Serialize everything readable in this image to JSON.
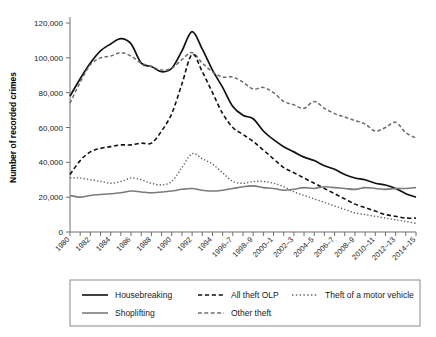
{
  "chart_data": {
    "type": "line",
    "title": "",
    "xlabel": "",
    "ylabel": "Number of recorded crimes",
    "ylim": [
      0,
      120000
    ],
    "ytick_labels": [
      "0",
      "20,000",
      "40,000",
      "60,000",
      "80,000",
      "100,000",
      "120,000"
    ],
    "ytick_values": [
      0,
      20000,
      40000,
      60000,
      80000,
      100000,
      120000
    ],
    "grid": false,
    "legend_position": "bottom",
    "categories": [
      "1980",
      "1981",
      "1982",
      "1983",
      "1984",
      "1985",
      "1986",
      "1987",
      "1988",
      "1989",
      "1990",
      "1991",
      "1992",
      "1993",
      "1994",
      "1995",
      "1996-7",
      "1997-8",
      "1998-9",
      "1999-2000",
      "2000-1",
      "2001-2",
      "2002-3",
      "2003-4",
      "2004-5",
      "2005-6",
      "2006-7",
      "2007-8",
      "2008-9",
      "2009-10",
      "2010-11",
      "2011-12",
      "2012-13",
      "2013-14",
      "2014-15"
    ],
    "xtick_labels_shown": [
      "1980",
      "1982",
      "1984",
      "1986",
      "1988",
      "1990",
      "1992",
      "1994",
      "1996-7",
      "1998-9",
      "2000-1",
      "2002-3",
      "2004-5",
      "2006-7",
      "2008-9",
      "2010-11",
      "2012-13",
      "2014-15"
    ],
    "series": [
      {
        "name": "Housebreaking",
        "style": "solid",
        "color": "#111111",
        "width": 1.7,
        "values": [
          78000,
          88000,
          97000,
          104000,
          108000,
          111000,
          108000,
          97000,
          95000,
          92000,
          94000,
          104000,
          115000,
          105000,
          93000,
          83000,
          72000,
          67000,
          65000,
          58000,
          53000,
          49000,
          46000,
          43000,
          41000,
          38000,
          36000,
          33000,
          31000,
          30000,
          28000,
          27000,
          25000,
          22000,
          20000
        ]
      },
      {
        "name": "Other theft",
        "style": "dashed-long",
        "color": "#6b6b6b",
        "width": 1.5,
        "values": [
          74000,
          86000,
          96000,
          100000,
          101000,
          103000,
          101000,
          97000,
          95000,
          93000,
          94000,
          99000,
          103000,
          97000,
          92000,
          89000,
          89000,
          86000,
          82000,
          83000,
          80000,
          75000,
          73000,
          71000,
          75000,
          71000,
          68000,
          66000,
          64000,
          62000,
          58000,
          60000,
          63000,
          57000,
          54000
        ]
      },
      {
        "name": "All theft OLP",
        "style": "dashed",
        "color": "#111111",
        "width": 1.6,
        "values": [
          33000,
          41000,
          46000,
          48000,
          49000,
          50000,
          50000,
          51000,
          51000,
          58000,
          68000,
          85000,
          102000,
          92000,
          80000,
          68000,
          60000,
          56000,
          52000,
          47000,
          42000,
          37000,
          34000,
          31000,
          28000,
          25000,
          22000,
          19000,
          16000,
          14000,
          12000,
          10000,
          9000,
          8000,
          8000
        ]
      },
      {
        "name": "Theft of a motor vehicle",
        "style": "dotted",
        "color": "#5e5e5e",
        "width": 1.4,
        "values": [
          31000,
          31000,
          30000,
          29000,
          28000,
          29000,
          31000,
          30000,
          28000,
          27000,
          29000,
          37000,
          45000,
          42000,
          39000,
          34000,
          29000,
          28000,
          29000,
          29000,
          28000,
          26000,
          23000,
          21000,
          19000,
          17000,
          15000,
          13000,
          11000,
          10000,
          9000,
          8000,
          7000,
          6000,
          5000
        ]
      },
      {
        "name": "Shoplifting",
        "style": "solid",
        "color": "#7b7b7b",
        "width": 1.6,
        "values": [
          21000,
          20000,
          21000,
          21500,
          22000,
          22500,
          23500,
          23000,
          22500,
          23000,
          23500,
          24500,
          25000,
          24000,
          23500,
          24000,
          25000,
          26000,
          26500,
          25500,
          25000,
          24000,
          24500,
          25500,
          25000,
          26000,
          25500,
          25000,
          24500,
          25500,
          25000,
          24500,
          25000,
          25000,
          25500
        ]
      }
    ],
    "legend": [
      {
        "label": "Housebreaking",
        "style": "solid",
        "color": "#111111"
      },
      {
        "label": "All theft OLP",
        "style": "dashed",
        "color": "#111111"
      },
      {
        "label": "Theft of a motor vehicle",
        "style": "dotted",
        "color": "#5e5e5e"
      },
      {
        "label": "Shoplifting",
        "style": "solid",
        "color": "#7b7b7b"
      },
      {
        "label": "Other theft",
        "style": "dashed-long",
        "color": "#6b6b6b"
      }
    ]
  }
}
